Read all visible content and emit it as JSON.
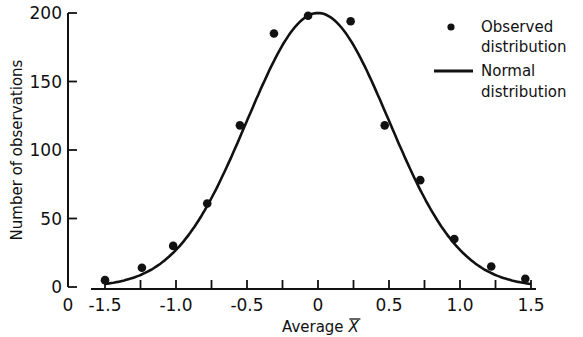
{
  "chart_data": {
    "type": "scatter",
    "title": "",
    "xlabel": "Average X̄",
    "xlabel_text": "Average ",
    "xlabel_symbol": "X",
    "ylabel": "Number of observations",
    "xlim": [
      -1.5,
      1.5
    ],
    "ylim": [
      0,
      200
    ],
    "grid": false,
    "legend_position": "upper right",
    "x_ticks": [
      -1.5,
      -1.0,
      -0.5,
      0,
      0.5,
      1.0,
      1.5
    ],
    "x_tick_labels": [
      "-1.5",
      "-1.0",
      "-0.5",
      "0",
      "0.5",
      "1.0",
      "1.5"
    ],
    "x_minor_ticks": [
      -1.25,
      -0.75,
      -0.25,
      0.25,
      0.75,
      1.25
    ],
    "x_origin_label": "0",
    "y_ticks": [
      0,
      50,
      100,
      150,
      200
    ],
    "y_tick_labels": [
      "0",
      "50",
      "100",
      "150",
      "200"
    ],
    "series": [
      {
        "name": "Observed distribution",
        "type": "scatter",
        "marker": "filled-circle",
        "x": [
          -1.5,
          -1.24,
          -1.02,
          -0.78,
          -0.55,
          -0.31,
          -0.07,
          0.23,
          0.47,
          0.72,
          0.96,
          1.22,
          1.46
        ],
        "y": [
          5,
          14,
          30,
          61,
          118,
          185,
          198,
          194,
          118,
          78,
          35,
          15,
          6
        ]
      },
      {
        "name": "Normal distribution",
        "type": "line",
        "peak": 200,
        "mean": 0,
        "sd": 0.5,
        "x_range": [
          -1.5,
          1.5
        ]
      }
    ],
    "legend": [
      {
        "marker": "dot",
        "lines": [
          "Observed",
          "distribution"
        ]
      },
      {
        "marker": "line",
        "lines": [
          "Normal",
          "distribution"
        ]
      }
    ]
  }
}
